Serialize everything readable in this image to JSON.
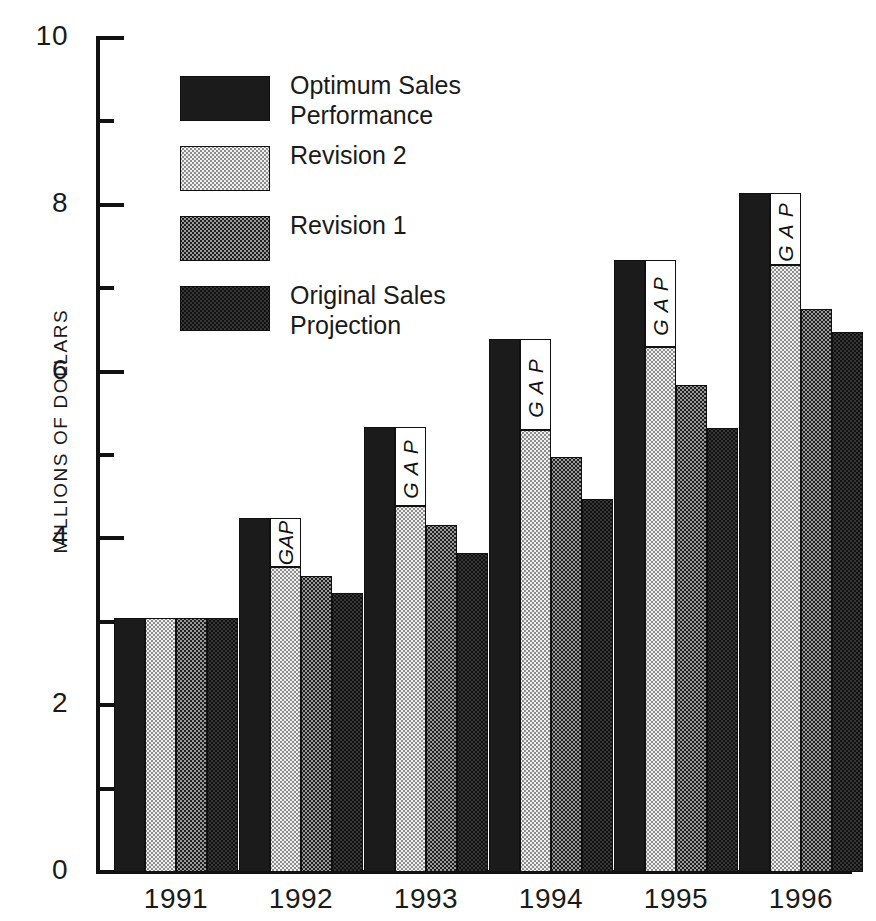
{
  "chart_data": {
    "type": "bar",
    "title": "",
    "subtitle": "",
    "xlabel": "",
    "ylabel": "MILLIONS OF DOLLARS",
    "categories": [
      "1991",
      "1992",
      "1993",
      "1994",
      "1995",
      "1996"
    ],
    "ylim": [
      0,
      10
    ],
    "y_ticks_major": [
      0,
      2,
      4,
      6,
      8,
      10
    ],
    "y_tick_labels": [
      "0",
      "2",
      "4",
      "6",
      "8",
      "10"
    ],
    "y_ticks_minor": [
      1,
      3,
      5,
      7,
      9
    ],
    "grid": false,
    "legend_position": "upper-left-inside",
    "series": [
      {
        "name": "Optimum Sales Performance",
        "pattern": "solid-black",
        "color": "#1b1b1b",
        "values": [
          3.05,
          4.24,
          5.34,
          6.39,
          7.34,
          8.14
        ]
      },
      {
        "name": "Revision 2",
        "pattern": "light-dotted",
        "color": "#f0f0ee",
        "values": [
          3.05,
          3.66,
          4.39,
          5.3,
          6.3,
          7.28
        ]
      },
      {
        "name": "Revision 1",
        "pattern": "medium-checker",
        "color": "#9a9a9a",
        "values": [
          3.05,
          3.55,
          4.16,
          4.98,
          5.84,
          6.75
        ]
      },
      {
        "name": "Original Sales Projection",
        "pattern": "dark-checker",
        "color": "#4a4a4a",
        "values": [
          3.05,
          3.34,
          3.82,
          4.47,
          5.32,
          6.47
        ]
      }
    ],
    "annotations": [
      {
        "label": "GAP",
        "category": "1992",
        "from": 3.66,
        "to": 4.24,
        "spaced": false
      },
      {
        "label": "G A P",
        "category": "1993",
        "from": 4.39,
        "to": 5.34,
        "spaced": true
      },
      {
        "label": "G A P",
        "category": "1994",
        "from": 5.3,
        "to": 6.39,
        "spaced": true
      },
      {
        "label": "G A P",
        "category": "1995",
        "from": 6.3,
        "to": 7.34,
        "spaced": true
      },
      {
        "label": "G A P",
        "category": "1996",
        "from": 7.28,
        "to": 8.14,
        "spaced": true
      }
    ]
  },
  "legend": {
    "items": [
      {
        "label": "Optimum Sales Performance",
        "swatch": "solid-black"
      },
      {
        "label": "Revision 2",
        "swatch": "light-dotted"
      },
      {
        "label": "Revision 1",
        "swatch": "medium-checker"
      },
      {
        "label": "Original Sales Projection",
        "swatch": "dark-checker"
      }
    ]
  },
  "axis": {
    "y_title": "MILLIONS OF DOLLARS",
    "y_labels": [
      "10",
      "8",
      "6",
      "4",
      "2",
      "0"
    ],
    "x_labels": [
      "1991",
      "1992",
      "1993",
      "1994",
      "1995",
      "1996"
    ]
  }
}
